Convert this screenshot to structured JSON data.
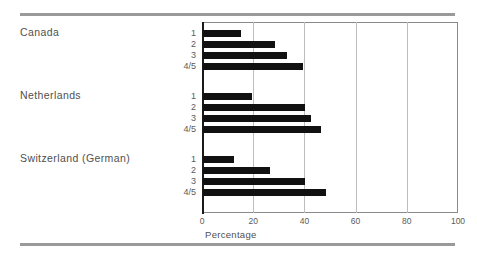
{
  "chart_data": {
    "type": "bar",
    "orientation": "horizontal",
    "title": "",
    "xlabel": "Percentage",
    "ylabel": "",
    "xlim": [
      0,
      100
    ],
    "xticks": [
      0,
      20,
      40,
      60,
      80,
      100
    ],
    "xtick_labels": [
      "0",
      "20",
      "40",
      "60",
      "80",
      "100"
    ],
    "grid": "vertical",
    "legend": "none",
    "categories": [
      "1",
      "2",
      "3",
      "4/5"
    ],
    "groups": [
      {
        "name": "Canada",
        "categories": [
          "1",
          "2",
          "3",
          "4/5"
        ],
        "values": [
          15,
          28,
          33,
          39
        ]
      },
      {
        "name": "Netherlands",
        "categories": [
          "1",
          "2",
          "3",
          "4/5"
        ],
        "values": [
          19,
          40,
          42,
          46
        ]
      },
      {
        "name": "Switzerland (German)",
        "categories": [
          "1",
          "2",
          "3",
          "4/5"
        ],
        "values": [
          12,
          26,
          40,
          48
        ]
      }
    ]
  },
  "colors": {
    "bar": "#111111",
    "grid": "#bdbdbd",
    "rule": "#9a9a9a",
    "text": "#4f4f4f",
    "axis": "#1a1a1a"
  }
}
